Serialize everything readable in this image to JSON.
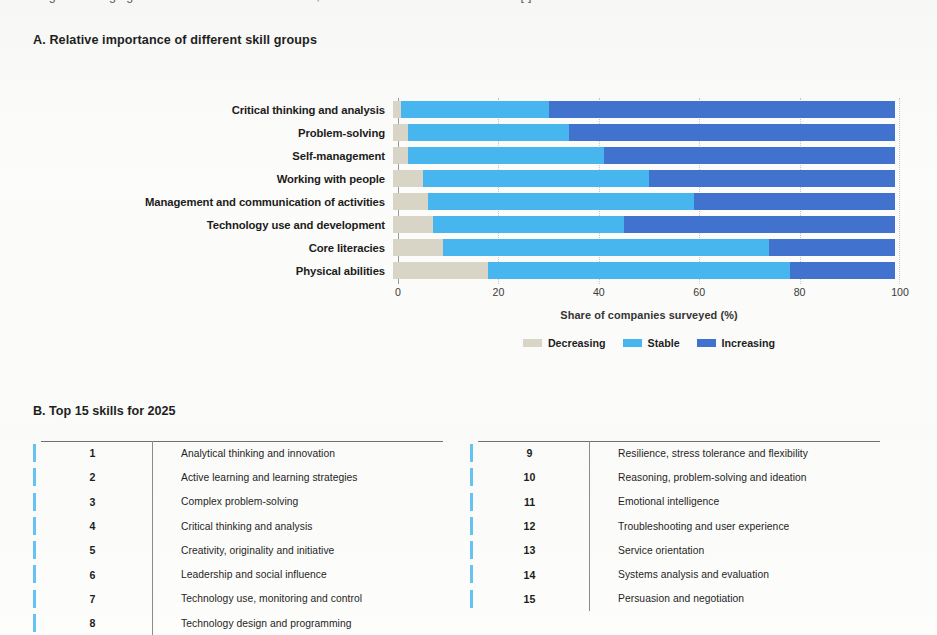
{
  "top_caption": {
    "ghost_text": "Figure    Changing skill demands across industries, World Economic Forum estimates [   ]"
  },
  "panel_a": {
    "title": "A. Relative importance of different skill groups",
    "x_axis_title": "Share of companies surveyed (%)",
    "legend": [
      {
        "label": "Decreasing",
        "color": "#d8d5c7",
        "icon": "legend-swatch-decreasing"
      },
      {
        "label": "Stable",
        "color": "#47b5ee",
        "icon": "legend-swatch-stable"
      },
      {
        "label": "Increasing",
        "color": "#4072ce",
        "icon": "legend-swatch-increasing"
      }
    ]
  },
  "panel_b": {
    "title": "B. Top 15 skills for 2025",
    "left_column": [
      {
        "rank": "1",
        "skill": "Analytical thinking and innovation"
      },
      {
        "rank": "2",
        "skill": "Active learning and learning strategies"
      },
      {
        "rank": "3",
        "skill": "Complex problem-solving"
      },
      {
        "rank": "4",
        "skill": "Critical thinking and analysis"
      },
      {
        "rank": "5",
        "skill": "Creativity, originality and initiative"
      },
      {
        "rank": "6",
        "skill": "Leadership and social influence"
      },
      {
        "rank": "7",
        "skill": "Technology use, monitoring and control"
      },
      {
        "rank": "8",
        "skill": "Technology design and programming"
      }
    ],
    "right_column": [
      {
        "rank": "9",
        "skill": "Resilience, stress tolerance and flexibility"
      },
      {
        "rank": "10",
        "skill": "Reasoning, problem-solving and ideation"
      },
      {
        "rank": "11",
        "skill": "Emotional intelligence"
      },
      {
        "rank": "12",
        "skill": "Troubleshooting and user experience"
      },
      {
        "rank": "13",
        "skill": "Service orientation"
      },
      {
        "rank": "14",
        "skill": "Systems analysis and evaluation"
      },
      {
        "rank": "15",
        "skill": "Persuasion and negotiation"
      }
    ]
  },
  "chart_data": {
    "type": "bar",
    "orientation": "horizontal",
    "stacked": true,
    "normalized_to": 100,
    "title": "A. Relative importance of different skill groups",
    "xlabel": "Share of companies surveyed (%)",
    "ylabel": "",
    "xlim": [
      0,
      100
    ],
    "xticks": [
      0,
      20,
      40,
      60,
      80,
      100
    ],
    "grid": "vertical-dotted",
    "legend_position": "bottom-center",
    "categories": [
      "Critical thinking and analysis",
      "Problem-solving",
      "Self-management",
      "Working with people",
      "Management and communication of activities",
      "Technology use and development",
      "Core literacies",
      "Physical abilities"
    ],
    "series": [
      {
        "name": "Decreasing",
        "color": "#d8d5c7",
        "values": [
          1.5,
          3,
          3,
          6,
          7,
          8,
          10,
          19
        ]
      },
      {
        "name": "Stable",
        "color": "#47b5ee",
        "values": [
          29.5,
          32,
          39,
          45,
          53,
          38,
          65,
          60
        ]
      },
      {
        "name": "Increasing",
        "color": "#4072ce",
        "values": [
          69,
          65,
          58,
          49,
          40,
          54,
          25,
          21
        ]
      }
    ]
  }
}
